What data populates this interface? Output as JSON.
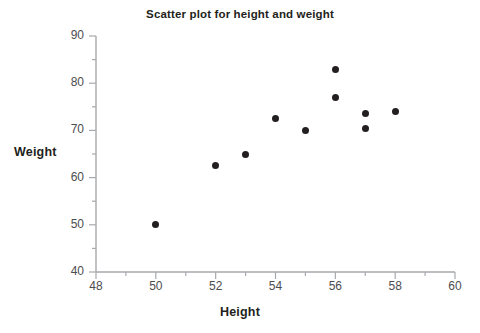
{
  "chart_data": {
    "type": "scatter",
    "title": "Scatter plot for height and weight",
    "xlabel": "Height",
    "ylabel": "Weight",
    "xlim": [
      48,
      60
    ],
    "ylim": [
      40,
      90
    ],
    "x_major_ticks": [
      48,
      50,
      52,
      54,
      56,
      58,
      60
    ],
    "y_major_ticks": [
      40,
      50,
      60,
      70,
      80,
      90
    ],
    "x_minor_tick_step": 1,
    "y_minor_tick_step": 5,
    "x_tick_labels": [
      "48",
      "50",
      "52",
      "54",
      "56",
      "58",
      "60"
    ],
    "y_tick_labels": [
      "40",
      "50",
      "60",
      "70",
      "80",
      "90"
    ],
    "grid": false,
    "legend": null,
    "marker": {
      "shape": "circle",
      "color": "#231f20",
      "size_px": 7
    },
    "axis_color": "#a7a9ac",
    "points": [
      {
        "x": 50,
        "y": 50
      },
      {
        "x": 52,
        "y": 62.5
      },
      {
        "x": 53,
        "y": 65
      },
      {
        "x": 54,
        "y": 72.5
      },
      {
        "x": 55,
        "y": 70
      },
      {
        "x": 56,
        "y": 83
      },
      {
        "x": 56,
        "y": 77
      },
      {
        "x": 57,
        "y": 73.5
      },
      {
        "x": 57,
        "y": 70.3
      },
      {
        "x": 58,
        "y": 74
      }
    ]
  }
}
